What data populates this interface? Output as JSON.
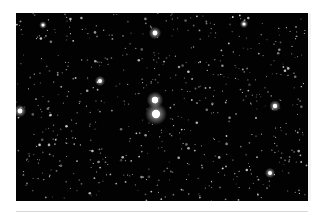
{
  "image": {
    "subject": "star field",
    "description": "Dense star field with a bright double star at center",
    "background_color": "#020202",
    "bright_stars": [
      {
        "x": 139,
        "y": 87,
        "r": 3.2
      },
      {
        "x": 140,
        "y": 101,
        "r": 4.2
      },
      {
        "x": 139,
        "y": 20,
        "r": 2.4
      },
      {
        "x": 4,
        "y": 98,
        "r": 2.4
      },
      {
        "x": 259,
        "y": 93,
        "r": 2.2
      },
      {
        "x": 84,
        "y": 68,
        "r": 2.0
      },
      {
        "x": 254,
        "y": 160,
        "r": 2.0
      },
      {
        "x": 228,
        "y": 11,
        "r": 1.6
      },
      {
        "x": 27,
        "y": 12,
        "r": 1.5
      }
    ],
    "faint_star_count": 650,
    "star_color": "#ffffff"
  },
  "separator": {
    "color": "#d8d8d8"
  }
}
